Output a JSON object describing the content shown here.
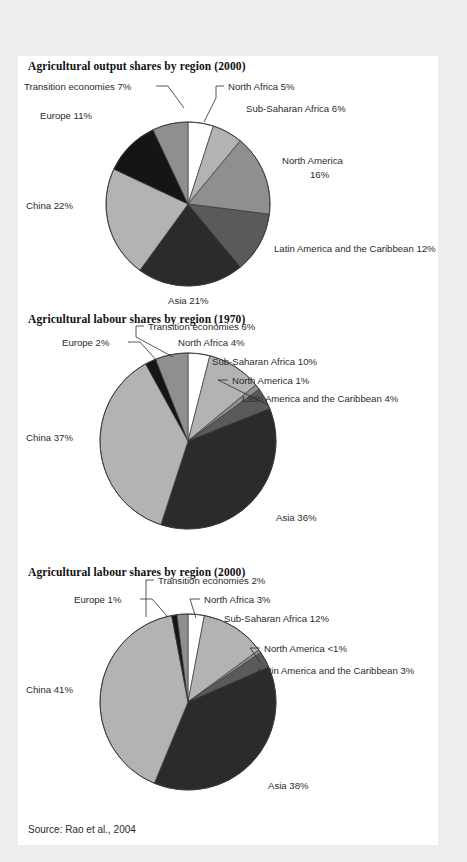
{
  "document": {
    "background_color": "#ededed",
    "panel_color": "#ffffff",
    "source_note": "Source: Rao et al., 2004"
  },
  "palette": {
    "white": "#ffffff",
    "light_grey": "#b3b3b3",
    "mid_grey": "#8f8f8f",
    "dark_grey": "#5a5a5a",
    "near_black": "#2b2b2b",
    "black": "#111111",
    "outline": "#3a3a3a",
    "text": "#2b2b2b"
  },
  "charts": [
    {
      "id": "agricultural-output-shares-2000",
      "title": "Agricultural output shares by region (2000)"
    },
    {
      "id": "agricultural-labour-shares-1970",
      "title": "Agricultural labour shares by region (1970)"
    },
    {
      "id": "agricultural-labour-shares-2000",
      "title": "Agricultural labour shares by region (2000)"
    }
  ],
  "chart_data": [
    {
      "type": "pie",
      "title": "Agricultural output shares by region (2000)",
      "xlabel": "",
      "ylabel": "",
      "legend": "labels-with-leader-lines",
      "grid": false,
      "start_angle_deg": 0,
      "direction": "clockwise",
      "units": "percent of total",
      "categories": [
        "North Africa",
        "Sub-Saharan Africa",
        "North America",
        "Latin America and the Caribbean",
        "Asia",
        "China",
        "Europe",
        "Transition economies"
      ],
      "values": [
        5,
        6,
        16,
        12,
        21,
        22,
        11,
        7
      ],
      "labels": [
        "North Africa 5%",
        "Sub-Saharan Africa 6%",
        "North America 16%",
        "Latin America and the Caribbean 12%",
        "Asia 21%",
        "China 22%",
        "Europe 11%",
        "Transition economies 7%"
      ],
      "colors": [
        "#ffffff",
        "#b3b3b3",
        "#8f8f8f",
        "#5a5a5a",
        "#2b2b2b",
        "#b3b3b3",
        "#151515",
        "#8f8f8f"
      ]
    },
    {
      "type": "pie",
      "title": "Agricultural labour shares by region (1970)",
      "xlabel": "",
      "ylabel": "",
      "legend": "labels-with-leader-lines",
      "grid": false,
      "start_angle_deg": 0,
      "direction": "clockwise",
      "units": "percent of total",
      "categories": [
        "North Africa",
        "Sub-Saharan Africa",
        "North America",
        "Latin America and the Caribbean",
        "Asia",
        "China",
        "Europe",
        "Transition economies"
      ],
      "values": [
        4,
        10,
        1,
        4,
        36,
        37,
        2,
        6
      ],
      "labels": [
        "North Africa 4%",
        "Sub-Saharan Africa 10%",
        "North America 1%",
        "Latin America and the Caribbean 4%",
        "Asia 36%",
        "China 37%",
        "Europe 2%",
        "Transition economies 6%"
      ],
      "colors": [
        "#ffffff",
        "#b3b3b3",
        "#8f8f8f",
        "#5a5a5a",
        "#2b2b2b",
        "#b3b3b3",
        "#151515",
        "#8f8f8f"
      ]
    },
    {
      "type": "pie",
      "title": "Agricultural labour shares by region (2000)",
      "xlabel": "",
      "ylabel": "",
      "legend": "labels-with-leader-lines",
      "grid": false,
      "start_angle_deg": 0,
      "direction": "clockwise",
      "units": "percent of total",
      "categories": [
        "North Africa",
        "Sub-Saharan Africa",
        "North America",
        "Latin America and the Caribbean",
        "Asia",
        "China",
        "Europe",
        "Transition economies"
      ],
      "values": [
        3,
        12,
        0.6,
        3,
        38,
        41,
        1,
        2
      ],
      "labels": [
        "North Africa 3%",
        "Sub-Saharan Africa 12%",
        "North America <1%",
        "Latin America and the Caribbean 3%",
        "Asia 38%",
        "China 41%",
        "Europe 1%",
        "Transition economies 2%"
      ],
      "colors": [
        "#ffffff",
        "#b3b3b3",
        "#8f8f8f",
        "#5a5a5a",
        "#2b2b2b",
        "#b3b3b3",
        "#151515",
        "#8f8f8f"
      ]
    }
  ],
  "geometry": [
    {
      "block_top": 0,
      "title_top": 4,
      "cx": 170,
      "cy": 148,
      "r": 82,
      "svg_height": 252,
      "annotations": [
        {
          "key": "North Africa",
          "text_x": 208,
          "text_y": 40,
          "anchor": "start",
          "leader": "M 200 36 L 194 36 L 194 48 L 182 66"
        },
        {
          "key": "Sub-Saharan Africa",
          "text_x": 226,
          "text_y": 58,
          "anchor": "start",
          "leader": ""
        },
        {
          "key": "North America",
          "text_x": 262,
          "text_y": 108,
          "anchor": "start",
          "leader": ""
        },
        {
          "key": "North America 2",
          "text_x": 262,
          "text_y": 122,
          "anchor": "start",
          "leader": ""
        },
        {
          "key": "Latin America and the Caribbean",
          "text_x": 258,
          "text_y": 196,
          "anchor": "start",
          "leader": ""
        },
        {
          "key": "Asia",
          "text_x": 148,
          "text_y": 250,
          "anchor": "start",
          "leader": ""
        },
        {
          "key": "China",
          "text_x": 8,
          "text_y": 154,
          "anchor": "start",
          "leader": ""
        },
        {
          "key": "Europe",
          "text_x": 18,
          "text_y": 62,
          "anchor": "start",
          "leader": ""
        },
        {
          "key": "Transition economies",
          "text_x": 6,
          "text_y": 33,
          "anchor": "start",
          "leader": "M 134 29 L 146 29 L 162 52"
        }
      ]
    },
    {
      "block_top": 253,
      "title_top": 4,
      "cx": 170,
      "cy": 132,
      "r": 88,
      "svg_height": 250,
      "annotations": []
    },
    {
      "block_top": 506,
      "title_top": 4,
      "cx": 170,
      "cy": 140,
      "r": 88,
      "svg_height": 255,
      "annotations": []
    }
  ],
  "chart_labels_layout": [
    {
      "items": [
        {
          "text": "Transition economies 7%",
          "x": 6,
          "y": 34,
          "anchor": "start",
          "leader": [
            [
              138,
              30
            ],
            [
              150,
              30
            ],
            [
              166,
              52
            ]
          ]
        },
        {
          "text": "North Africa 5%",
          "x": 210,
          "y": 34,
          "anchor": "start",
          "leader": [
            [
              206,
              30
            ],
            [
              198,
              30
            ],
            [
              198,
              42
            ],
            [
              186,
              66
            ]
          ]
        },
        {
          "text": "Sub-Saharan Africa 6%",
          "x": 228,
          "y": 56,
          "anchor": "start",
          "leader": []
        },
        {
          "text": "Europe 11%",
          "x": 22,
          "y": 63,
          "anchor": "start",
          "leader": []
        },
        {
          "text": "North America",
          "x": 264,
          "y": 108,
          "anchor": "start",
          "leader": []
        },
        {
          "text": "16%",
          "x": 292,
          "y": 122,
          "anchor": "start",
          "leader": []
        },
        {
          "text": "China 22%",
          "x": 8,
          "y": 153,
          "anchor": "start",
          "leader": []
        },
        {
          "text": "Latin America and the Caribbean 12%",
          "x": 256,
          "y": 196,
          "anchor": "start",
          "leader": []
        },
        {
          "text": "Asia 21%",
          "x": 150,
          "y": 248,
          "anchor": "start",
          "leader": []
        }
      ]
    },
    {
      "items": [
        {
          "text": "Transition economies 6%",
          "x": 130,
          "y": 21,
          "anchor": "start",
          "leader": [
            [
              126,
              17
            ],
            [
              118,
              17
            ],
            [
              118,
              28
            ],
            [
              155,
              48
            ]
          ]
        },
        {
          "text": "Europe 2%",
          "x": 44,
          "y": 37,
          "anchor": "start",
          "leader": [
            [
              110,
              33
            ],
            [
              122,
              33
            ],
            [
              139,
              52
            ]
          ]
        },
        {
          "text": "North Africa 4%",
          "x": 160,
          "y": 37,
          "anchor": "start",
          "leader": []
        },
        {
          "text": "Sub-Saharan Africa 10%",
          "x": 194,
          "y": 56,
          "anchor": "start",
          "leader": []
        },
        {
          "text": "North America 1%",
          "x": 214,
          "y": 75,
          "anchor": "start",
          "leader": [
            [
              210,
              71
            ],
            [
              200,
              71
            ],
            [
              250,
              96
            ]
          ]
        },
        {
          "text": "Latin America and the Caribbean 4%",
          "x": 224,
          "y": 93,
          "anchor": "start",
          "leader": []
        },
        {
          "text": "China 37%",
          "x": 8,
          "y": 132,
          "anchor": "start",
          "leader": []
        },
        {
          "text": "Asia 36%",
          "x": 258,
          "y": 212,
          "anchor": "start",
          "leader": []
        }
      ]
    },
    {
      "items": [
        {
          "text": "Transition economies 2%",
          "x": 140,
          "y": 22,
          "anchor": "start",
          "leader": [
            [
              136,
              18
            ],
            [
              128,
              18
            ],
            [
              128,
              55
            ]
          ]
        },
        {
          "text": "Europe 1%",
          "x": 56,
          "y": 41,
          "anchor": "start",
          "leader": [
            [
              122,
              37
            ],
            [
              134,
              37
            ],
            [
              150,
              55
            ]
          ]
        },
        {
          "text": "North Africa 3%",
          "x": 186,
          "y": 41,
          "anchor": "start",
          "leader": [
            [
              182,
              37
            ],
            [
              172,
              37
            ],
            [
              178,
              56
            ]
          ]
        },
        {
          "text": "Sub-Saharan Africa 12%",
          "x": 206,
          "y": 60,
          "anchor": "start",
          "leader": []
        },
        {
          "text": "North America <1%",
          "x": 246,
          "y": 90,
          "anchor": "start",
          "leader": [
            [
              242,
              86
            ],
            [
              232,
              86
            ],
            [
              242,
              100
            ]
          ]
        },
        {
          "text": "Latin America and the Caribbean 3%",
          "x": 240,
          "y": 112,
          "anchor": "start",
          "leader": []
        },
        {
          "text": "China 41%",
          "x": 8,
          "y": 131,
          "anchor": "start",
          "leader": []
        },
        {
          "text": "Asia 38%",
          "x": 250,
          "y": 227,
          "anchor": "start",
          "leader": []
        }
      ]
    }
  ]
}
